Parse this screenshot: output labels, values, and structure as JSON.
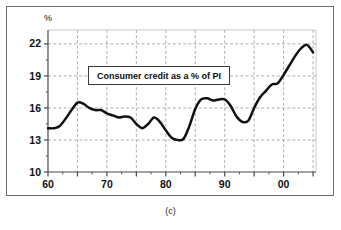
{
  "caption": "(c)",
  "axis_unit_label": "%",
  "series_label": "Consumer credit as a % of PI",
  "colors": {
    "line": "#111111",
    "grid": "#9a9a9a",
    "axis": "#4a4a4a",
    "frame": "#6e6e6e",
    "background": "#ffffff"
  },
  "chart_data": {
    "type": "line",
    "title": "Consumer credit as a % of PI",
    "xlabel": "",
    "ylabel": "%",
    "ylim": [
      10,
      23.3
    ],
    "xlim": [
      1960,
      2005.5
    ],
    "ytick_values": [
      10,
      13,
      16,
      19,
      22
    ],
    "ytick_labels": [
      "10",
      "13",
      "16",
      "19",
      "22"
    ],
    "xtick_values": [
      1960,
      1970,
      1980,
      1990,
      2000
    ],
    "xtick_labels": [
      "60",
      "70",
      "80",
      "90",
      "00"
    ],
    "xminor_values": [
      1965,
      1975,
      1985,
      1995,
      2005
    ],
    "grid": true,
    "grid_style": "dashed",
    "legend": "none",
    "annotations": [
      {
        "text": "Consumer credit as a % of PI",
        "x": 1974.5,
        "y": 19.6,
        "boxed": true
      }
    ],
    "series": [
      {
        "name": "Consumer credit as a % of PI",
        "x": [
          1960,
          1961,
          1962,
          1963,
          1964,
          1965,
          1966,
          1967,
          1968,
          1969,
          1970,
          1971,
          1972,
          1973,
          1974,
          1975,
          1976,
          1977,
          1978,
          1979,
          1980,
          1981,
          1982,
          1983,
          1984,
          1985,
          1986,
          1987,
          1988,
          1989,
          1990,
          1991,
          1992,
          1993,
          1994,
          1995,
          1996,
          1997,
          1998,
          1999,
          2000,
          2001,
          2002,
          2003,
          2004,
          2005
        ],
        "values": [
          14.1,
          14.1,
          14.3,
          15.0,
          15.8,
          16.5,
          16.4,
          16.0,
          15.8,
          15.8,
          15.5,
          15.3,
          15.1,
          15.2,
          15.1,
          14.5,
          14.1,
          14.5,
          15.1,
          14.7,
          13.9,
          13.2,
          13.0,
          13.1,
          14.3,
          15.9,
          16.8,
          16.9,
          16.7,
          16.8,
          16.8,
          16.2,
          15.2,
          14.7,
          14.8,
          16.0,
          17.0,
          17.6,
          18.2,
          18.3,
          19.1,
          20.0,
          20.9,
          21.6,
          21.9,
          21.2
        ]
      }
    ]
  }
}
